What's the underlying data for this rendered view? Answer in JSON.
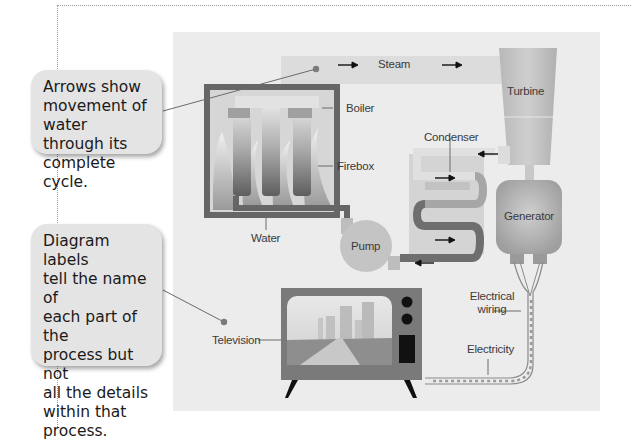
{
  "callouts": [
    {
      "text": "Arrows show\nmovement of\nwater through its\ncomplete cycle."
    },
    {
      "text": "Diagram labels\ntell the name of\neach part of the\nprocess but not\nall the details\nwithin that\nprocess."
    }
  ],
  "labels": {
    "steam": "Steam",
    "turbine": "Turbine",
    "boiler": "Boiler",
    "firebox": "Firebox",
    "condenser": "Condenser",
    "water": "Water",
    "generator": "Generator",
    "pump": "Pump",
    "electrical_wiring_1": "Electrical",
    "electrical_wiring_2": "wiring",
    "television": "Television",
    "electricity": "Electricity"
  },
  "colors": {
    "panel_bg": "#ececec",
    "callout_bg": "#e4e4e4",
    "pipe_dark": "#6e6e6e",
    "pipe_light": "#d2d2d2",
    "component_fill": "#bdbdbd"
  }
}
